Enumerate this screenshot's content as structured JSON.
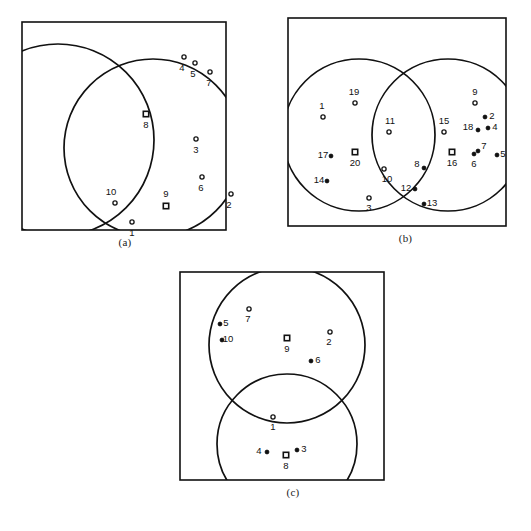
{
  "figure": {
    "title": "",
    "background_color": "#ffffff",
    "stroke_color": "#111111",
    "panel_count": 3
  },
  "panels": [
    {
      "id": "a",
      "caption": "(a)",
      "frame": {
        "x": 22,
        "y": 22,
        "w": 204,
        "h": 208
      },
      "circles": [
        {
          "name": "circle-1",
          "cx": 36,
          "cy": 118,
          "r": 96
        },
        {
          "name": "circle-2",
          "cx": 131,
          "cy": 126,
          "r": 89
        }
      ],
      "points": [
        {
          "label": "1",
          "x": 110,
          "y": 200,
          "lx": 110,
          "ly": 214,
          "marker": "open"
        },
        {
          "label": "2",
          "x": 209,
          "y": 172,
          "lx": 207,
          "ly": 186,
          "marker": "open"
        },
        {
          "label": "3",
          "x": 174,
          "y": 117,
          "lx": 174,
          "ly": 131,
          "marker": "open"
        },
        {
          "label": "4",
          "x": 162,
          "y": 35,
          "lx": 160,
          "ly": 49,
          "marker": "open"
        },
        {
          "label": "5",
          "x": 173,
          "y": 41,
          "lx": 171,
          "ly": 55,
          "marker": "open"
        },
        {
          "label": "7",
          "x": 188,
          "y": 50,
          "lx": 187,
          "ly": 64,
          "marker": "open"
        },
        {
          "label": "6",
          "x": 180,
          "y": 155,
          "lx": 179,
          "ly": 169,
          "marker": "open"
        },
        {
          "label": "10",
          "x": 93,
          "y": 181,
          "lx": 89,
          "ly": 173,
          "marker": "open"
        }
      ],
      "centroids": [
        {
          "label": "8",
          "x": 124,
          "y": 92,
          "lx": 124,
          "ly": 106
        },
        {
          "label": "9",
          "x": 144,
          "y": 184,
          "lx": 144,
          "ly": 175
        }
      ]
    },
    {
      "id": "b",
      "caption": "(b)",
      "frame": {
        "x": 8,
        "y": 18,
        "w": 218,
        "h": 208
      },
      "circles": [
        {
          "name": "circle-left",
          "cx": 71,
          "cy": 117,
          "r": 76
        },
        {
          "name": "circle-right",
          "cx": 160,
          "cy": 117,
          "r": 76
        }
      ],
      "points": [
        {
          "label": "1",
          "x": 35,
          "y": 99,
          "lx": 34,
          "ly": 91,
          "marker": "open"
        },
        {
          "label": "19",
          "x": 67,
          "y": 85,
          "lx": 66,
          "ly": 77,
          "marker": "open"
        },
        {
          "label": "11",
          "x": 101,
          "y": 114,
          "lx": 102,
          "ly": 106,
          "marker": "open"
        },
        {
          "label": "15",
          "x": 156,
          "y": 114,
          "lx": 156,
          "ly": 106,
          "marker": "open"
        },
        {
          "label": "9",
          "x": 187,
          "y": 85,
          "lx": 187,
          "ly": 77,
          "marker": "open"
        },
        {
          "label": "2",
          "x": 197,
          "y": 99,
          "lx": 204,
          "ly": 101,
          "marker": "solid"
        },
        {
          "label": "4",
          "x": 200,
          "y": 110,
          "lx": 207,
          "ly": 112,
          "marker": "solid"
        },
        {
          "label": "18",
          "x": 190,
          "y": 112,
          "lx": 180,
          "ly": 112,
          "marker": "solid"
        },
        {
          "label": "5",
          "x": 209,
          "y": 137,
          "lx": 215,
          "ly": 139,
          "marker": "solid"
        },
        {
          "label": "7",
          "x": 190,
          "y": 133,
          "lx": 196,
          "ly": 131,
          "marker": "solid"
        },
        {
          "label": "6",
          "x": 186,
          "y": 136,
          "lx": 186,
          "ly": 149,
          "marker": "solid"
        },
        {
          "label": "17",
          "x": 43,
          "y": 138,
          "lx": 35,
          "ly": 140,
          "marker": "solid"
        },
        {
          "label": "14",
          "x": 39,
          "y": 163,
          "lx": 31,
          "ly": 165,
          "marker": "solid"
        },
        {
          "label": "10",
          "x": 96,
          "y": 151,
          "lx": 99,
          "ly": 164,
          "marker": "open"
        },
        {
          "label": "8",
          "x": 136,
          "y": 150,
          "lx": 129,
          "ly": 149,
          "marker": "solid"
        },
        {
          "label": "12",
          "x": 127,
          "y": 171,
          "lx": 118,
          "ly": 173,
          "marker": "solid"
        },
        {
          "label": "13",
          "x": 136,
          "y": 186,
          "lx": 144,
          "ly": 188,
          "marker": "solid"
        },
        {
          "label": "3",
          "x": 81,
          "y": 180,
          "lx": 81,
          "ly": 193,
          "marker": "open"
        }
      ],
      "centroids": [
        {
          "label": "20",
          "x": 67,
          "y": 134,
          "lx": 67,
          "ly": 148
        },
        {
          "label": "16",
          "x": 164,
          "y": 134,
          "lx": 164,
          "ly": 148
        }
      ]
    },
    {
      "id": "c",
      "caption": "(c)",
      "frame": {
        "x": 7,
        "y": 10,
        "w": 204,
        "h": 208
      },
      "circles": [
        {
          "name": "circle-top",
          "cx": 107,
          "cy": 73,
          "r": 78
        },
        {
          "name": "circle-bottom",
          "cx": 107,
          "cy": 172,
          "r": 70
        }
      ],
      "points": [
        {
          "label": "7",
          "x": 69,
          "y": 37,
          "lx": 68,
          "ly": 50,
          "marker": "open"
        },
        {
          "label": "5",
          "x": 40,
          "y": 52,
          "lx": 46,
          "ly": 54,
          "marker": "solid"
        },
        {
          "label": "10",
          "x": 42,
          "y": 68,
          "lx": 48,
          "ly": 70,
          "marker": "solid"
        },
        {
          "label": "2",
          "x": 150,
          "y": 60,
          "lx": 149,
          "ly": 73,
          "marker": "open"
        },
        {
          "label": "6",
          "x": 131,
          "y": 89,
          "lx": 138,
          "ly": 91,
          "marker": "solid"
        },
        {
          "label": "1",
          "x": 93,
          "y": 145,
          "lx": 93,
          "ly": 158,
          "marker": "open"
        },
        {
          "label": "4",
          "x": 87,
          "y": 180,
          "lx": 79,
          "ly": 182,
          "marker": "solid"
        },
        {
          "label": "3",
          "x": 117,
          "y": 178,
          "lx": 124,
          "ly": 180,
          "marker": "solid"
        }
      ],
      "centroids": [
        {
          "label": "9",
          "x": 107,
          "y": 66,
          "lx": 107,
          "ly": 80
        },
        {
          "label": "8",
          "x": 106,
          "y": 183,
          "lx": 106,
          "ly": 197
        }
      ]
    }
  ],
  "panel_positions": [
    {
      "id": "a",
      "left": 0,
      "top": 0,
      "width": 250,
      "height": 258,
      "caption_top": 236
    },
    {
      "id": "b",
      "left": 280,
      "top": 0,
      "width": 251,
      "height": 258,
      "caption_top": 232
    },
    {
      "id": "c",
      "left": 173,
      "top": 262,
      "width": 240,
      "height": 265,
      "caption_top": 486
    }
  ]
}
